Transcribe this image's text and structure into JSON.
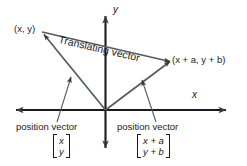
{
  "figure": {
    "background_color": "#ffffff",
    "line_color": "#3a3a3a",
    "text_color": "#1a1a1a"
  },
  "axes": {
    "x_label": "x",
    "y_label": "y",
    "origin_label": ""
  },
  "points": {
    "start_label": "(x, y)",
    "end_label": "(x + a, y + b)"
  },
  "vectors": {
    "translating_label": "Translating vector",
    "position_left_label": "position vector",
    "position_right_label": "position vector"
  },
  "matrices": {
    "left": {
      "row1": "x",
      "row2": "y"
    },
    "right": {
      "row1": "x + a",
      "row2": "y + b"
    }
  }
}
